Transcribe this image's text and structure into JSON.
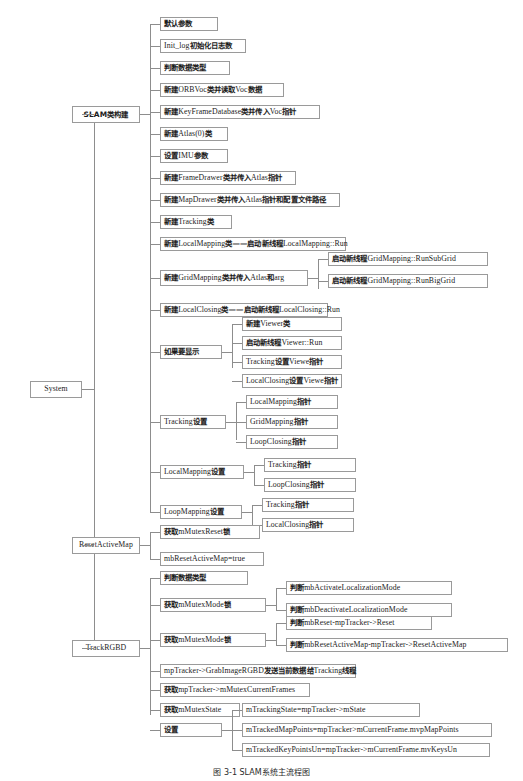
{
  "figure": {
    "type": "tree-diagram",
    "caption": "图 3-1 SLAM系统主流程图",
    "root": "System",
    "branches": [
      "SLAM类构建",
      "ResetActiveMap",
      "TrackRGBD"
    ]
  },
  "nodes": {
    "system": "System",
    "slam_build": "SLAM类构建",
    "reset_active_map": "ResetActiveMap",
    "track_rgbd": "TrackRGBD",
    "slam_children": [
      {
        "cn": "默认参数",
        "en": ""
      },
      {
        "cn": "",
        "en": "Init_log",
        "cn2": "初始化日志数"
      },
      {
        "cn": "判断数据类型",
        "en": ""
      },
      {
        "cn": "新建",
        "en": "ORBVoc",
        "cn2": "类并读取",
        "en2": "Voc",
        "cn3": "数据"
      },
      {
        "cn": "新建",
        "en": "KeyFrameDatabase",
        "cn2": "类并传入",
        "en2": "Voc",
        "cn3": "指针"
      },
      {
        "cn": "新建",
        "en": "Atlas(0)",
        "cn2": "类"
      },
      {
        "cn": "设置",
        "en": "IMU",
        "cn2": "参数"
      },
      {
        "cn": "新建",
        "en": "FrameDrawer",
        "cn2": "类并传入",
        "en2": "Atlas",
        "cn3": "指针"
      },
      {
        "cn": "新建",
        "en": "MapDrawer",
        "cn2": "类并传入",
        "en2": "Atlas",
        "cn3": "指针和配置文件路径"
      },
      {
        "cn": "新建",
        "en": "Tracking",
        "cn2": "类"
      },
      {
        "cn": "新建",
        "en": "LocalMapping",
        "cn2": "类——启动新线程",
        "en2": "LocalMapping::Run"
      },
      {
        "cn": "新建",
        "en": "GridMapping",
        "cn2": "类并传入",
        "en2": "Atlas",
        "cn3": "和",
        "en3": "arg"
      },
      {
        "cn": "新建",
        "en": "LocalClosing",
        "cn2": "类——启动新线程",
        "en2": "LocalClosing::Run"
      },
      {
        "cn": "如果要显示",
        "en": ""
      },
      {
        "cn": "",
        "en": "Tracking",
        "cn2": "设置"
      },
      {
        "cn": "",
        "en": "LocalMapping",
        "cn2": "设置"
      },
      {
        "cn": "",
        "en": "LoopMapping",
        "cn2": "设置"
      }
    ],
    "grid_mapping_children": [
      {
        "cn": "启动新线程",
        "en": "GridMapping::RunSubGrid"
      },
      {
        "cn": "启动新线程",
        "en": "GridMapping::RunBigGrid"
      }
    ],
    "viewer_children": [
      {
        "cn": "新建",
        "en": "Viewer",
        "cn2": "类"
      },
      {
        "cn": "启动新线程",
        "en": "Viewer::Run"
      },
      {
        "cn": "",
        "en": "Tracking",
        "cn2": "设置",
        "en2": "Viewe",
        "cn3": "指针"
      },
      {
        "cn": "",
        "en": "LocalClosing",
        "cn2": "设置",
        "en2": "Viewe",
        "cn3": "指针"
      }
    ],
    "tracking_setting_children": [
      {
        "cn": "",
        "en": "LocalMapping",
        "cn2": "指针"
      },
      {
        "cn": "",
        "en": "GridMapping",
        "cn2": "指针"
      },
      {
        "cn": "",
        "en": "LoopClosing",
        "cn2": "指针"
      }
    ],
    "localmapping_setting_children": [
      {
        "cn": "",
        "en": "Tracking",
        "cn2": "指针"
      },
      {
        "cn": "",
        "en": "LoopClosing",
        "cn2": "指针"
      }
    ],
    "loopmapping_setting_children": [
      {
        "cn": "",
        "en": "Tracking",
        "cn2": "指针"
      },
      {
        "cn": "",
        "en": "LocalClosing",
        "cn2": "指针"
      }
    ],
    "reset_children": [
      {
        "cn": "获取",
        "en": "mMutexReset",
        "cn2": "锁"
      },
      {
        "cn": "",
        "en": "mbResetActiveMap=true"
      }
    ],
    "track_children": [
      {
        "cn": "判断数据类型",
        "en": ""
      },
      {
        "cn": "获取",
        "en": "mMutexMode",
        "cn2": "锁"
      },
      {
        "cn": "获取",
        "en": "mMutexMode",
        "cn2": "锁"
      },
      {
        "cn": "",
        "en": "mpTracker->GrabImageRGBD",
        "cn2": "发送当前数据给",
        "en2": "Tracking",
        "cn3": "线程"
      },
      {
        "cn": "获取",
        "en": "mpTracker->mMutexCurrentFrames"
      },
      {
        "cn": "获取",
        "en": "mMutexState"
      },
      {
        "cn": "设置",
        "en": ""
      }
    ],
    "mode_lock_children_1": [
      {
        "cn": "判断",
        "en": "mbActivateLocalizationMode"
      },
      {
        "cn": "判断",
        "en": "mbDeactivateLocalizationMode"
      }
    ],
    "mode_lock_children_2": [
      {
        "cn": "判断",
        "en": "mbReset-mpTracker->Reset"
      },
      {
        "cn": "判断",
        "en": "mbResetActiveMap-mpTracker->ResetActiveMap"
      }
    ],
    "set_children": [
      {
        "cn": "",
        "en": "mTrackingState=mpTracker->mState"
      },
      {
        "cn": "",
        "en": "mTrackedMapPoints=mpTracker>mCurrentFrame.mvpMapPoints"
      },
      {
        "cn": "",
        "en": "mTrackedKeyPointsUn=mpTracker->mCurrentFrame.mvKeysUn"
      }
    ]
  },
  "colors": {
    "border": "#9a9a9a",
    "edge": "#8d8d8d",
    "text": "#1b1b1b",
    "background": "#ffffff"
  }
}
